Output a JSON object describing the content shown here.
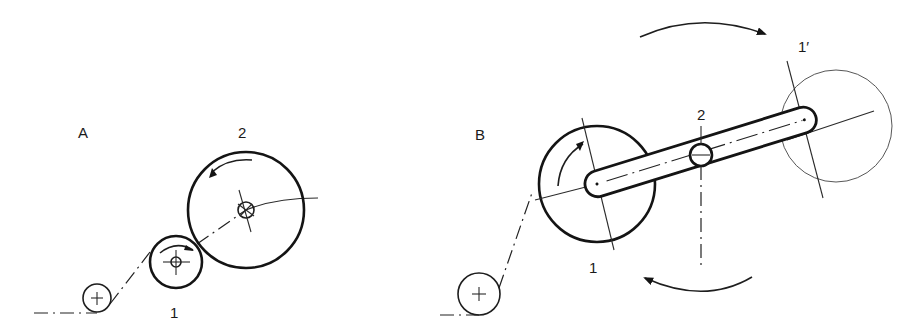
{
  "figure": {
    "panel_a": {
      "label": "A",
      "roller_labels": {
        "roller_1": "1",
        "roller_2": "2"
      }
    },
    "panel_b": {
      "label": "B",
      "part_labels": {
        "disc_1": "1",
        "pivot_2": "2",
        "disc_1_prime": "1′"
      }
    },
    "colors": {
      "line": "#141414",
      "background": "#ffffff"
    }
  }
}
